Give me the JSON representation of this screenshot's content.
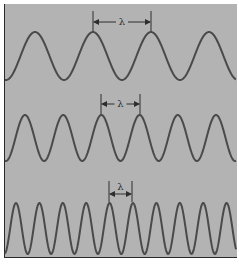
{
  "figure": {
    "background": "#b3b3b3",
    "wave_color": "#4a4a4a",
    "annotation_color": "#2e2e2e",
    "symbol": "λ"
  },
  "waves": [
    {
      "name": "long-wavelength",
      "label": "λ",
      "peak_y": 32,
      "trough_y": 80,
      "period_px": 58,
      "first_peak_x": 35,
      "marker_from_x": 93,
      "marker_to_x": 151,
      "marker_line_top": 11,
      "arrow_y": 22,
      "label_y": 24
    },
    {
      "name": "medium-wavelength",
      "label": "λ",
      "peak_y": 115,
      "trough_y": 161,
      "period_px": 38.2,
      "first_peak_x": 25,
      "marker_from_x": 101,
      "marker_to_x": 140,
      "marker_line_top": 94,
      "arrow_y": 104,
      "label_y": 106
    },
    {
      "name": "short-wavelength",
      "label": "λ",
      "peak_y": 203,
      "trough_y": 254,
      "period_px": 23.4,
      "first_peak_x": 16,
      "marker_from_x": 109,
      "marker_to_x": 132,
      "marker_line_top": 181,
      "arrow_y": 194,
      "label_y": 190
    }
  ]
}
